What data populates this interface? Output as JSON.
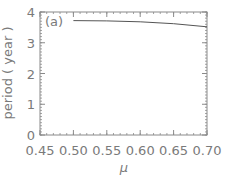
{
  "chart_data": {
    "type": "line",
    "title": "",
    "panel_label": "(a)",
    "xlabel": "μ",
    "ylabel": "period ( year )",
    "xlim": [
      0.45,
      0.7
    ],
    "ylim": [
      0,
      4
    ],
    "xticks": [
      "0.45",
      "0.50",
      "0.55",
      "0.60",
      "0.65",
      "0.70"
    ],
    "yticks": [
      "0",
      "1",
      "2",
      "3",
      "4"
    ],
    "grid": false,
    "legend": null,
    "series": [
      {
        "name": "period",
        "x": [
          0.5,
          0.55,
          0.6,
          0.65,
          0.7
        ],
        "y": [
          3.72,
          3.71,
          3.68,
          3.62,
          3.52
        ]
      }
    ]
  },
  "colors": {
    "axis": "#8a8a8a",
    "line": "#555555",
    "text": "#7a7a7a"
  }
}
